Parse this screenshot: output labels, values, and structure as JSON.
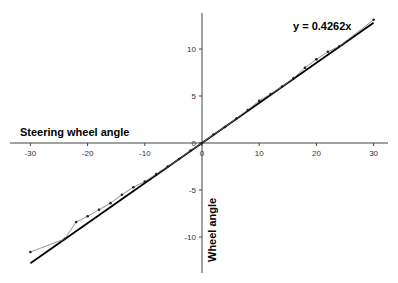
{
  "chart_data": {
    "type": "scatter",
    "title": "",
    "xlabel": "Steering wheel angle",
    "ylabel": "Wheel angle",
    "xlim": [
      -32,
      33
    ],
    "ylim": [
      -14,
      14
    ],
    "x_ticks": [
      -30,
      -20,
      -10,
      0,
      10,
      20,
      30
    ],
    "y_ticks": [
      -10,
      -5,
      0,
      5,
      10
    ],
    "grid": false,
    "legend": null,
    "series": [
      {
        "name": "Measured",
        "style": "thin line with dot markers",
        "x": [
          -30,
          -24,
          -22,
          -20,
          -18,
          -16,
          -14,
          -12,
          -10,
          -8,
          -6,
          -4,
          -2,
          0,
          2,
          4,
          6,
          8,
          10,
          12,
          14,
          16,
          18,
          20,
          22,
          24,
          30
        ],
        "y": [
          -11.6,
          -10.2,
          -8.4,
          -7.8,
          -7.1,
          -6.4,
          -5.5,
          -4.7,
          -4.1,
          -3.3,
          -2.5,
          -1.7,
          -0.8,
          0,
          0.9,
          1.7,
          2.6,
          3.5,
          4.5,
          5.2,
          6.0,
          6.9,
          8.0,
          8.9,
          9.7,
          10.3,
          13.1
        ]
      },
      {
        "name": "Linear fit",
        "style": "thick line",
        "equation": "y = 0.4262x",
        "slope": 0.4262,
        "x": [
          -30,
          30
        ],
        "y": [
          -12.79,
          12.79
        ]
      }
    ],
    "annotations": [
      {
        "text": "y = 0.4262x",
        "position": "top-right"
      }
    ]
  }
}
